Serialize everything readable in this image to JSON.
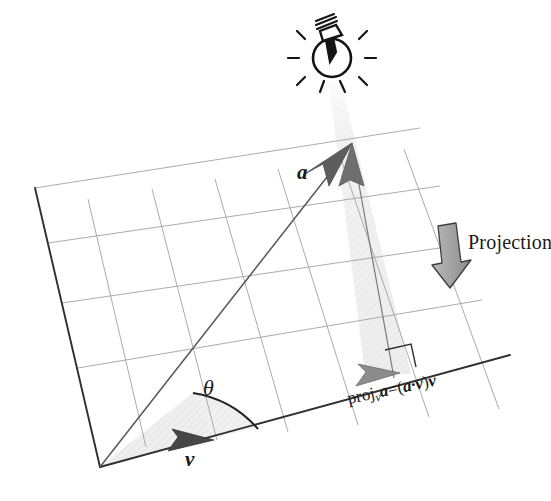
{
  "figure": {
    "background_color": "#ffffff"
  },
  "labels": {
    "projection": "Projection",
    "vector_a": "a",
    "vector_v": "v",
    "angle_theta": "θ",
    "projection_formula": {
      "proj": "proj",
      "sub": "v",
      "a": "a",
      "equals": "=",
      "open": "(",
      "dot_expr": "a·v",
      "close": ")",
      "tail": "v"
    }
  },
  "icons": {
    "lightbulb": "light-bulb-icon",
    "projection_arrow": "down-arrow-icon",
    "right_angle": "right-angle-marker"
  },
  "colors": {
    "stroke_dark": "#2b2b2b",
    "stroke_grid": "#9a9a9a",
    "shade_fill": "#ededed",
    "shadow_cone": "#ebebeb",
    "arrowhead_fill": "#555555",
    "arrowhead_fill_light": "#6e6e6e",
    "projection_arrow_fill": "#9d9d9d",
    "text": "#1a1a1a"
  },
  "geometry": {
    "plane_origin": [
      100,
      467
    ],
    "plane_left_top": [
      35,
      188
    ],
    "baseline_end": [
      510,
      355
    ],
    "vector_a_tip": [
      352,
      143
    ],
    "projection_foot": [
      394,
      378
    ],
    "bulb_center": [
      332,
      58
    ],
    "grid_columns": 5,
    "grid_rows": 4
  }
}
